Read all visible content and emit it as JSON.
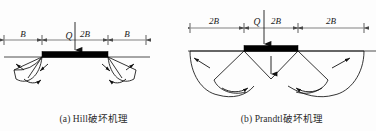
{
  "figure": {
    "background_color": "#fdfdfd",
    "line_color": "#111111",
    "footing_color": "#000000",
    "dimension_color": "#4a4a4a"
  },
  "panels": [
    {
      "id": "hill",
      "caption": "(a) Hill破坏机理",
      "load_label": "Q",
      "footing_width_label": "2B",
      "dimensions": [
        {
          "label": "B",
          "position": "left"
        },
        {
          "label": "2B",
          "position": "center"
        },
        {
          "label": "B",
          "position": "right"
        }
      ],
      "mechanism": "Hill",
      "wedge_count": 2,
      "slip_arrow_count": 4
    },
    {
      "id": "prandtl",
      "caption": "(b) Prandtl破坏机理",
      "load_label": "Q",
      "footing_width_label": "2B",
      "dimensions": [
        {
          "label": "2B",
          "position": "left"
        },
        {
          "label": "2B",
          "position": "center"
        },
        {
          "label": "2B",
          "position": "right"
        }
      ],
      "mechanism": "Prandtl",
      "wedge_count": 2,
      "slip_arrow_count": 4
    }
  ]
}
